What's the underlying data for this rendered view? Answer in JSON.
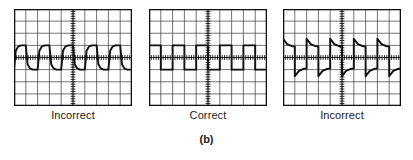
{
  "figure": {
    "label": "(b)",
    "panels": [
      {
        "caption": "Incorrect",
        "compensation": "undercompensated"
      },
      {
        "caption": "Correct",
        "compensation": "properly compensated"
      },
      {
        "caption": "Incorrect",
        "compensation": "overcompensated"
      }
    ]
  },
  "graticule": {
    "columns": 10,
    "rows": 8,
    "border_color": "#111111",
    "grid_color": "#3a3a3a",
    "trace_color": "#111111",
    "background": "#ffffff",
    "minor_ticks_per_division": 5
  },
  "chart_data": {
    "type": "line",
    "title": "(b)",
    "xlabel": "",
    "ylabel": "",
    "xlim": [
      0,
      10
    ],
    "ylim": [
      -4,
      4
    ],
    "grid": true,
    "legend": "none",
    "annotations": [
      "Incorrect",
      "Correct",
      "Incorrect",
      "(b)"
    ],
    "series": [
      {
        "name": "Incorrect (undercompensated square wave)",
        "cycles": 5,
        "high_level": 1.0,
        "low_level": -1.0,
        "edge_shape": "exponential-rounded",
        "x": [
          0.0,
          0.15,
          0.35,
          0.6,
          1.0,
          1.0,
          1.15,
          1.35,
          1.6,
          2.0,
          2.0,
          2.15,
          2.35,
          2.6,
          3.0,
          3.0,
          3.15,
          3.35,
          3.6,
          4.0,
          4.0,
          4.15,
          4.35,
          4.6,
          5.0,
          5.0,
          5.15,
          5.35,
          5.6,
          6.0,
          6.0,
          6.15,
          6.35,
          6.6,
          7.0,
          7.0,
          7.15,
          7.35,
          7.6,
          8.0,
          8.0,
          8.15,
          8.35,
          8.6,
          9.0,
          9.0,
          9.15,
          9.35,
          9.6,
          10.0
        ],
        "y": [
          -1.0,
          0.55,
          0.9,
          1.0,
          1.0,
          1.0,
          -0.55,
          -0.9,
          -1.0,
          -1.0,
          -1.0,
          0.55,
          0.9,
          1.0,
          1.0,
          1.0,
          -0.55,
          -0.9,
          -1.0,
          -1.0,
          -1.0,
          0.55,
          0.9,
          1.0,
          1.0,
          1.0,
          -0.55,
          -0.9,
          -1.0,
          -1.0,
          -1.0,
          0.55,
          0.9,
          1.0,
          1.0,
          1.0,
          -0.55,
          -0.9,
          -1.0,
          -1.0,
          -1.0,
          0.55,
          0.9,
          1.0,
          1.0,
          1.0,
          -0.55,
          -0.9,
          -1.0,
          -1.0
        ]
      },
      {
        "name": "Correct (flat square wave)",
        "cycles": 5,
        "high_level": 1.0,
        "low_level": -1.0,
        "edge_shape": "square",
        "x": [
          0,
          1,
          1,
          2,
          2,
          3,
          3,
          4,
          4,
          5,
          5,
          6,
          6,
          7,
          7,
          8,
          8,
          9,
          9,
          10
        ],
        "y": [
          1,
          1,
          -1,
          -1,
          1,
          1,
          -1,
          -1,
          1,
          1,
          -1,
          -1,
          1,
          1,
          -1,
          -1,
          1,
          1,
          -1,
          -1
        ]
      },
      {
        "name": "Incorrect (overcompensated square wave)",
        "cycles": 5,
        "high_level": 1.0,
        "low_level": -1.0,
        "overshoot": 1.55,
        "undershoot": -1.55,
        "edge_shape": "spike-with-exponential-decay",
        "x": [
          0.0,
          0.0,
          0.35,
          0.7,
          1.0,
          1.0,
          1.0,
          1.35,
          1.7,
          2.0,
          2.0,
          2.0,
          2.35,
          2.7,
          3.0,
          3.0,
          3.0,
          3.35,
          3.7,
          4.0,
          4.0,
          4.0,
          4.35,
          4.7,
          5.0,
          5.0,
          5.0,
          5.35,
          5.7,
          6.0,
          6.0,
          6.0,
          6.35,
          6.7,
          7.0,
          7.0,
          7.0,
          7.35,
          7.7,
          8.0,
          8.0,
          8.0,
          8.35,
          8.7,
          9.0,
          9.0,
          9.0,
          9.35,
          9.7,
          10.0
        ],
        "y": [
          -1.55,
          1.55,
          1.1,
          0.95,
          0.9,
          0.9,
          -1.55,
          -1.1,
          -0.95,
          -0.9,
          -0.9,
          1.55,
          1.1,
          0.95,
          0.9,
          0.9,
          -1.55,
          -1.1,
          -0.95,
          -0.9,
          -0.9,
          1.55,
          1.1,
          0.95,
          0.9,
          0.9,
          -1.55,
          -1.1,
          -0.95,
          -0.9,
          -0.9,
          1.55,
          1.1,
          0.95,
          0.9,
          0.9,
          -1.55,
          -1.1,
          -0.95,
          -0.9,
          -0.9,
          1.55,
          1.1,
          0.95,
          0.9,
          0.9,
          -1.55,
          -1.1,
          -0.95,
          -0.9
        ]
      }
    ]
  }
}
